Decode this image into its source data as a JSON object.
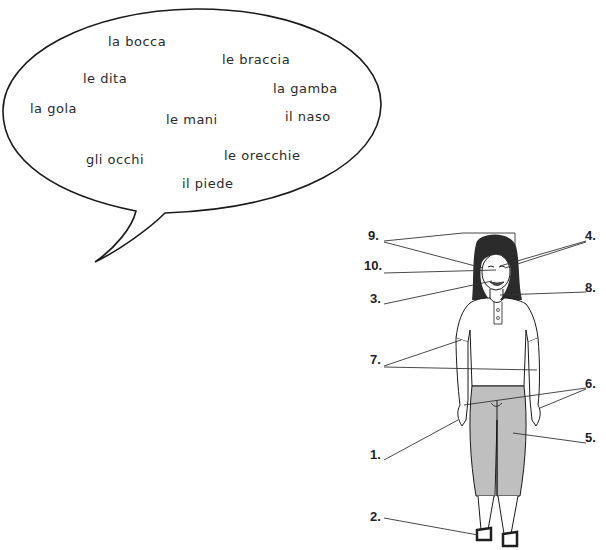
{
  "bubble": {
    "words": [
      {
        "text": "la bocca",
        "x": 108,
        "y": 34
      },
      {
        "text": "le braccia",
        "x": 222,
        "y": 52
      },
      {
        "text": "le dita",
        "x": 83,
        "y": 71
      },
      {
        "text": "la gamba",
        "x": 273,
        "y": 81
      },
      {
        "text": "la gola",
        "x": 30,
        "y": 101
      },
      {
        "text": "le mani",
        "x": 166,
        "y": 112
      },
      {
        "text": "il naso",
        "x": 285,
        "y": 109
      },
      {
        "text": "gli occhi",
        "x": 86,
        "y": 152
      },
      {
        "text": "le orecchie",
        "x": 224,
        "y": 148
      },
      {
        "text": "il piede",
        "x": 182,
        "y": 176
      }
    ]
  },
  "figure": {
    "labels": [
      {
        "id": "9",
        "text": "9.",
        "x": 368,
        "y": 236
      },
      {
        "id": "10",
        "text": "10.",
        "x": 364,
        "y": 266
      },
      {
        "id": "3",
        "text": "3.",
        "x": 370,
        "y": 299
      },
      {
        "id": "7",
        "text": "7.",
        "x": 370,
        "y": 360
      },
      {
        "id": "1",
        "text": "1.",
        "x": 370,
        "y": 455
      },
      {
        "id": "2",
        "text": "2.",
        "x": 370,
        "y": 517
      },
      {
        "id": "4",
        "text": "4.",
        "x": 589,
        "y": 236
      },
      {
        "id": "8",
        "text": "8.",
        "x": 589,
        "y": 288
      },
      {
        "id": "6",
        "text": "6.",
        "x": 589,
        "y": 384
      },
      {
        "id": "5",
        "text": "5.",
        "x": 589,
        "y": 438
      }
    ]
  },
  "colors": {
    "outline": "#1a1a1a",
    "pants": "#bfbfbf",
    "hair": "#2b2b2b",
    "sandal": "#1f1f1f"
  }
}
